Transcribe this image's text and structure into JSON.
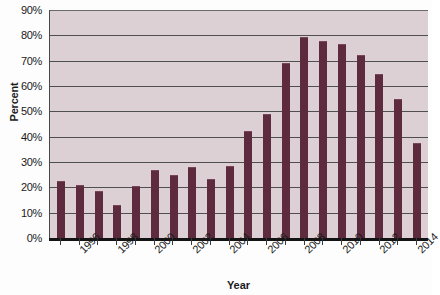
{
  "chart_data": {
    "type": "bar",
    "title": "",
    "xlabel": "Year",
    "ylabel": "Percent",
    "ylim": [
      0,
      90
    ],
    "ytick_labels": [
      "0%",
      "10%",
      "20%",
      "30%",
      "40%",
      "50%",
      "60%",
      "70%",
      "80%",
      "90%"
    ],
    "ytick_values": [
      0,
      10,
      20,
      30,
      40,
      50,
      60,
      70,
      80,
      90
    ],
    "grid": true,
    "legend": "none",
    "bar_color": "#5e2a3e",
    "plot_background": "#ddd0d4",
    "categories": [
      1995,
      1996,
      1997,
      1998,
      1999,
      2000,
      2001,
      2002,
      2003,
      2004,
      2005,
      2006,
      2007,
      2008,
      2009,
      2010,
      2011,
      2012,
      2013,
      2014
    ],
    "values": [
      22,
      20.5,
      18,
      12.5,
      20,
      26.5,
      24.5,
      27.5,
      23,
      28,
      42,
      48.5,
      68.5,
      79,
      77.5,
      76,
      72,
      64.5,
      54.5,
      37
    ],
    "xtick_labels_shown": [
      "1996",
      "1998",
      "2000",
      "2002",
      "2004",
      "2006",
      "2008",
      "2010",
      "2012",
      "2014"
    ],
    "xtick_label_indices": [
      1,
      3,
      5,
      7,
      9,
      11,
      13,
      15,
      17,
      19
    ]
  }
}
